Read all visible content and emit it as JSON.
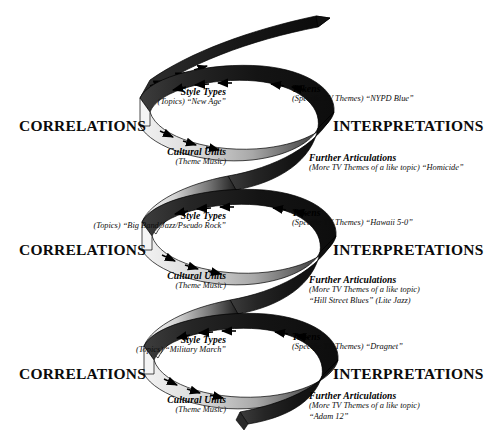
{
  "figure": {
    "type": "spiral-diagram",
    "title_visible": false,
    "left_axis_label": "CORRELATIONS",
    "right_axis_label": "INTERPRETATIONS",
    "colors": {
      "ribbon_dark": "#1a1a1a",
      "ribbon_light": "#e8e8e8",
      "ribbon_mid": "#9a9a9a",
      "outline": "#000000",
      "text": "#0b0b0b",
      "background": "#ffffff"
    },
    "turns": 3,
    "arrow_direction_front": "right",
    "arrow_direction_back": "left"
  },
  "loops": [
    {
      "id": "loop-1",
      "left_heading": "CORRELATIONS",
      "right_heading": "INTERPRETATIONS",
      "top_left": {
        "title": "Style Types",
        "subtitle": "(Topics) “New Age”"
      },
      "top_right": {
        "title": "Tokens",
        "subtitle": "(Specific TV Themes) “NYPD Blue”"
      },
      "bottom_left": {
        "title": "Cultural Units",
        "subtitle": "(Theme Music)"
      },
      "bottom_right": {
        "title": "Further Articulations",
        "subtitle": "(More TV Themes of a like topic) “Homicide”"
      }
    },
    {
      "id": "loop-2",
      "left_heading": "CORRELATIONS",
      "right_heading": "INTERPRETATIONS",
      "top_left": {
        "title": "Style Types",
        "subtitle": "(Topics) “Big Band/Jazz/Pseudo Rock”"
      },
      "top_right": {
        "title": "Tokens",
        "subtitle": "(Specific TV Themes) “Hawaii 5-0”"
      },
      "bottom_left": {
        "title": "Cultural Units",
        "subtitle": "(Theme Music)"
      },
      "bottom_right": {
        "title": "Further Articulations",
        "subtitle": "(More TV Themes of a like topic)",
        "subtitle2": "“Hill Street Blues” (Lite Jazz)"
      }
    },
    {
      "id": "loop-3",
      "left_heading": "CORRELATIONS",
      "right_heading": "INTERPRETATIONS",
      "top_left": {
        "title": "Style Types",
        "subtitle": "(Topics) “Military March”"
      },
      "top_right": {
        "title": "Tokens",
        "subtitle": "(Specific TV Themes) “Dragnet”"
      },
      "bottom_left": {
        "title": "Cultural Units",
        "subtitle": "(Theme Music)"
      },
      "bottom_right": {
        "title": "Further Articulations",
        "subtitle": "(More TV Themes of a like topic)",
        "subtitle2": "“Adam 12”"
      }
    }
  ]
}
